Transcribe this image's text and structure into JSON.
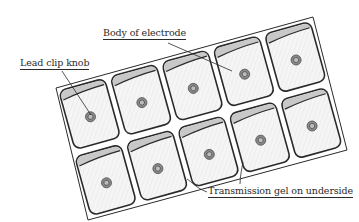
{
  "diagram": {
    "colors": {
      "outline": "#2a2a2a",
      "pad_fill": "#f4f4f4",
      "gel_band": "#c8c8c8",
      "knob_outer": "#8a8a8a",
      "knob_inner": "#5a5a5a",
      "background": "#ffffff"
    },
    "rows": 2,
    "columns": 5,
    "pad_count": 10
  },
  "labels": {
    "body_of_electrode": "Body of electrode",
    "lead_clip_knob": "Lead clip knob",
    "transmission_gel": "Transmission gel on underside"
  }
}
